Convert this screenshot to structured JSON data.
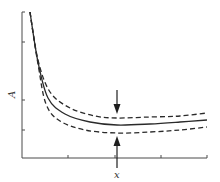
{
  "chart_data": {
    "type": "line",
    "title": "",
    "xlabel": "x",
    "ylabel": "A",
    "grid": false,
    "legend": null,
    "x_ticks": [
      "",
      "",
      ""
    ],
    "y_ticks": [
      "",
      "",
      ""
    ],
    "series": [
      {
        "name": "upper bound (dashed)",
        "style": "dashed",
        "points": [
          [
            30,
            12
          ],
          [
            38,
            60
          ],
          [
            50,
            92
          ],
          [
            70,
            108
          ],
          [
            95,
            116
          ],
          [
            117,
            118
          ],
          [
            150,
            117
          ],
          [
            180,
            116
          ],
          [
            207,
            113
          ]
        ]
      },
      {
        "name": "central curve (solid)",
        "style": "solid",
        "points": [
          [
            30,
            12
          ],
          [
            38,
            62
          ],
          [
            48,
            98
          ],
          [
            65,
            114
          ],
          [
            90,
            122
          ],
          [
            117,
            125
          ],
          [
            150,
            124
          ],
          [
            180,
            122
          ],
          [
            207,
            120
          ]
        ]
      },
      {
        "name": "lower bound (dashed)",
        "style": "dashed",
        "points": [
          [
            30,
            12
          ],
          [
            38,
            64
          ],
          [
            46,
            104
          ],
          [
            60,
            121
          ],
          [
            85,
            130
          ],
          [
            117,
            133
          ],
          [
            150,
            132
          ],
          [
            180,
            130
          ],
          [
            207,
            127
          ]
        ]
      }
    ],
    "annotations": [
      {
        "type": "arrow",
        "direction": "down",
        "x": 117,
        "from_y": 90,
        "to_y": 113,
        "note": "arrow pointing down to upper dashed curve at minimum"
      },
      {
        "type": "arrow",
        "direction": "up",
        "x": 117,
        "from_y": 168,
        "to_y": 137,
        "note": "arrow pointing up to lower dashed curve at minimum"
      }
    ],
    "axis_ranges": {
      "x_pixels": [
        22,
        207
      ],
      "y_pixels": [
        12,
        158
      ]
    }
  },
  "labels": {
    "x_axis": "x",
    "y_axis": "A"
  }
}
